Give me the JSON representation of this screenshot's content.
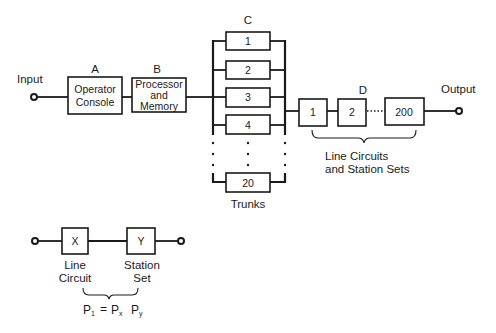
{
  "diagram": {
    "input_label": "Input",
    "output_label": "Output",
    "block_a": {
      "letter": "A",
      "lines": [
        "Operator",
        "Console"
      ]
    },
    "block_b": {
      "letter": "B",
      "lines": [
        "Processor",
        "and",
        "Memory"
      ]
    },
    "block_c": {
      "letter": "C",
      "trunks": [
        "1",
        "2",
        "3",
        "4",
        "20"
      ],
      "caption": "Trunks"
    },
    "block_d": {
      "letter": "D",
      "units": [
        "1",
        "2",
        "200"
      ],
      "caption_lines": [
        "Line Circuits",
        "and Station Sets"
      ]
    },
    "subsystem": {
      "x_box": "X",
      "y_box": "Y",
      "x_label_lines": [
        "Line",
        "Circuit"
      ],
      "y_label_lines": [
        "Station",
        "Set"
      ],
      "formula": {
        "lhs": "P",
        "lhs_sub": "1",
        "eq": "=",
        "t1": "P",
        "t1_sub": "x",
        "t2": "P",
        "t2_sub": "y"
      }
    }
  },
  "colors": {
    "ink": "#1a1a1a",
    "background": "#ffffff"
  }
}
